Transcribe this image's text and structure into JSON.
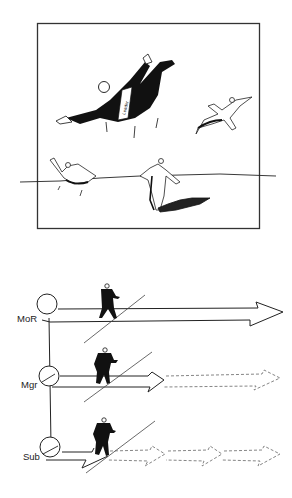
{
  "cartoon": {
    "frame": {
      "x": 37,
      "y": 23,
      "w": 223,
      "h": 206
    },
    "tie_text": "Leader",
    "figures": [
      "leader-diving",
      "follower-flying",
      "follower-swimming",
      "follower-wading"
    ]
  },
  "diagram": {
    "levels": [
      {
        "label": "MoR",
        "arrow": "solid-long"
      },
      {
        "label": "Mgr",
        "arrow": "solid-then-dashed"
      },
      {
        "label": "Sub",
        "arrow": "short-solid-then-dashed-chain"
      }
    ]
  },
  "colors": {
    "ink": "#111111",
    "paper": "#ffffff",
    "dash": "#777777"
  }
}
